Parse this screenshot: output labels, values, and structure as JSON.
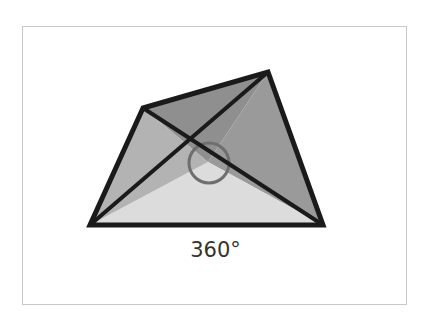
{
  "diagram": {
    "caption": "360°",
    "vertices": {
      "top_left": [
        143,
        108
      ],
      "top_right": [
        268,
        72
      ],
      "bottom_right": [
        323,
        225
      ],
      "bottom_left": [
        90,
        225
      ]
    },
    "center": [
      208,
      162
    ],
    "angle_marker_radius": 20,
    "colors": {
      "triangle_top": "#8f8f8f",
      "triangle_right": "#9a9a9a",
      "triangle_left": "#b3b3b3",
      "triangle_bottom": "#dcdcdc",
      "stroke": "#1a1a1a",
      "angle_marker": "#6e6e6e",
      "frame_border": "#c8c8c8",
      "caption": "#333333"
    }
  }
}
